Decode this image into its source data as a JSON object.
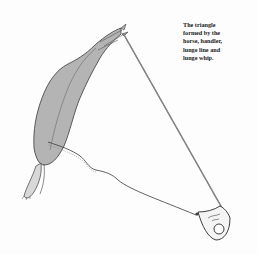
{
  "figure": {
    "caption_lines": [
      "The triangle",
      "formed by the",
      "horse, handler,",
      "lunge line and",
      "lunge whip."
    ],
    "elements": [
      "horse",
      "handler",
      "lunge-line",
      "lunge-whip"
    ],
    "colors": {
      "horse_fill": "#b4b4b4",
      "outline": "#3a3a3a",
      "whip": "#7a7a7a",
      "background": "#fdfdfd"
    }
  }
}
